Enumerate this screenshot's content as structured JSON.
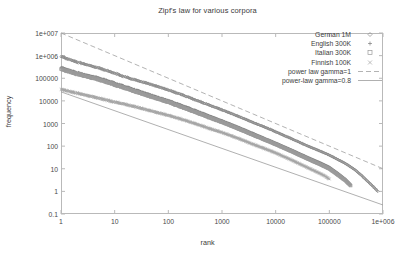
{
  "chart_data": {
    "type": "scatter",
    "title": "Zipf's law for various corpora",
    "xlabel": "rank",
    "ylabel": "frequency",
    "xscale": "log",
    "yscale": "log",
    "xlim": [
      1,
      1000000
    ],
    "ylim": [
      0.1,
      10000000
    ],
    "xticks": [
      "1",
      "10",
      "100",
      "1000",
      "10000",
      "100000",
      "1e+006"
    ],
    "xtick_values": [
      1,
      10,
      100,
      1000,
      10000,
      100000,
      1000000
    ],
    "yticks": [
      "0.1",
      "1",
      "10",
      "100",
      "1000",
      "10000",
      "100000",
      "1e+006",
      "1e+007"
    ],
    "ytick_values": [
      0.1,
      1,
      10,
      100,
      1000,
      10000,
      100000,
      1000000,
      10000000
    ],
    "grid": false,
    "legend_position": "top-right",
    "series": [
      {
        "name": "German 1M",
        "marker": "diamond",
        "color": "#8a8a8a",
        "points": [
          [
            1,
            900000
          ],
          [
            2,
            520000
          ],
          [
            3,
            400000
          ],
          [
            4,
            330000
          ],
          [
            6,
            250000
          ],
          [
            10,
            165000
          ],
          [
            20,
            95000
          ],
          [
            40,
            60000
          ],
          [
            70,
            40000
          ],
          [
            100,
            30000
          ],
          [
            200,
            17000
          ],
          [
            400,
            9000
          ],
          [
            700,
            5500
          ],
          [
            1000,
            4000
          ],
          [
            2000,
            2100
          ],
          [
            4000,
            1050
          ],
          [
            7000,
            620
          ],
          [
            10000,
            430
          ],
          [
            20000,
            210
          ],
          [
            40000,
            100
          ],
          [
            70000,
            58
          ],
          [
            100000,
            40
          ],
          [
            200000,
            17
          ],
          [
            300000,
            9
          ],
          [
            400000,
            5
          ],
          [
            500000,
            3
          ],
          [
            600000,
            2
          ],
          [
            700000,
            1.4
          ],
          [
            800000,
            1
          ]
        ]
      },
      {
        "name": "English 300K",
        "marker": "plus",
        "color": "#7d7d7d",
        "points": [
          [
            1,
            300000
          ],
          [
            2,
            180000
          ],
          [
            3,
            140000
          ],
          [
            5,
            105000
          ],
          [
            10,
            62000
          ],
          [
            20,
            36000
          ],
          [
            40,
            21000
          ],
          [
            70,
            13500
          ],
          [
            100,
            10500
          ],
          [
            200,
            5800
          ],
          [
            400,
            3100
          ],
          [
            700,
            1850
          ],
          [
            1000,
            1350
          ],
          [
            2000,
            700
          ],
          [
            4000,
            350
          ],
          [
            7000,
            200
          ],
          [
            10000,
            140
          ],
          [
            20000,
            68
          ],
          [
            40000,
            32
          ],
          [
            70000,
            18
          ],
          [
            100000,
            12
          ],
          [
            150000,
            6
          ],
          [
            200000,
            3.5
          ],
          [
            250000,
            2
          ]
        ]
      },
      {
        "name": "Italian 300K",
        "marker": "square",
        "color": "#9a9a9a",
        "points": [
          [
            1,
            250000
          ],
          [
            2,
            155000
          ],
          [
            3,
            120000
          ],
          [
            5,
            88000
          ],
          [
            10,
            52000
          ],
          [
            20,
            30000
          ],
          [
            40,
            17500
          ],
          [
            70,
            11500
          ],
          [
            100,
            8800
          ],
          [
            200,
            4800
          ],
          [
            400,
            2600
          ],
          [
            700,
            1550
          ],
          [
            1000,
            1150
          ],
          [
            2000,
            590
          ],
          [
            4000,
            295
          ],
          [
            7000,
            172
          ],
          [
            10000,
            120
          ],
          [
            20000,
            58
          ],
          [
            40000,
            27
          ],
          [
            70000,
            15
          ],
          [
            100000,
            10
          ],
          [
            150000,
            5
          ],
          [
            200000,
            3
          ],
          [
            250000,
            1.8
          ]
        ]
      },
      {
        "name": "Finnish 100K",
        "marker": "cross",
        "color": "#a5a5a5",
        "points": [
          [
            1,
            32000
          ],
          [
            2,
            22000
          ],
          [
            4,
            15000
          ],
          [
            8,
            10000
          ],
          [
            15,
            7200
          ],
          [
            30,
            4800
          ],
          [
            60,
            3100
          ],
          [
            100,
            2300
          ],
          [
            200,
            1400
          ],
          [
            400,
            820
          ],
          [
            700,
            520
          ],
          [
            1000,
            400
          ],
          [
            2000,
            220
          ],
          [
            4000,
            115
          ],
          [
            7000,
            70
          ],
          [
            10000,
            50
          ],
          [
            20000,
            24
          ],
          [
            40000,
            11
          ],
          [
            60000,
            7
          ],
          [
            80000,
            5
          ],
          [
            100000,
            3.5
          ]
        ]
      }
    ],
    "fit_lines": [
      {
        "name": "power law gamma=1",
        "style": "dashed",
        "color": "#a0a0a0",
        "gamma": 1,
        "points": [
          [
            1,
            10000000
          ],
          [
            1000000,
            10
          ]
        ]
      },
      {
        "name": "power-law gamma=0.8",
        "style": "solid",
        "color": "#9c9c9c",
        "gamma": 0.8,
        "points": [
          [
            1,
            25000
          ],
          [
            1000000,
            0.25
          ]
        ]
      }
    ]
  },
  "legend": {
    "entries": [
      {
        "label": "German 1M",
        "key": "diamond"
      },
      {
        "label": "English 300K",
        "key": "plus"
      },
      {
        "label": "Italian 300K",
        "key": "square"
      },
      {
        "label": "Finnish 100K",
        "key": "cross"
      },
      {
        "label": "power law gamma=1",
        "key": "dashed-line"
      },
      {
        "label": "power-law gamma=0.8",
        "key": "solid-line"
      }
    ]
  }
}
